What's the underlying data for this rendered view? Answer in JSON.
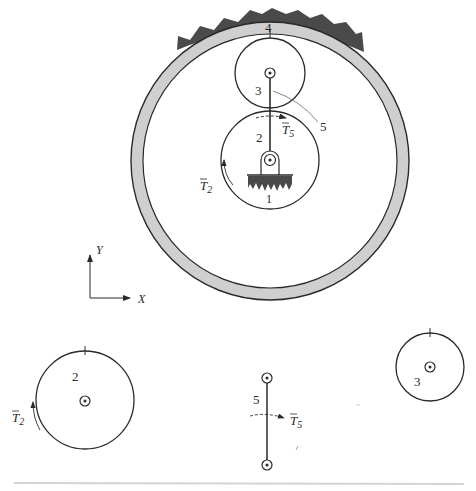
{
  "figure": {
    "type": "planetary gear train with free-body diagrams",
    "assembly": {
      "labels": {
        "ring_gear": "4",
        "planet_gear": "3",
        "sun_gear": "2",
        "ground": "1",
        "arm": "5",
        "torque_arm": "T",
        "torque_arm_sub": "5",
        "torque_sun": "T",
        "torque_sun_sub": "2"
      }
    },
    "axes": {
      "y_label": "Y",
      "x_label": "X"
    },
    "free_bodies": {
      "sun_gear": {
        "label": "2",
        "torque": "T",
        "torque_sub": "2"
      },
      "arm": {
        "label": "5",
        "torque": "T",
        "torque_sub": "5"
      },
      "planet_gear": {
        "label": "3"
      }
    },
    "colors": {
      "line": "#2a2a2a",
      "ring_fill": "#cfcfcf",
      "ground_fill": "#4a4a4a",
      "leader": "#777777",
      "separator": "#d4d4d4"
    }
  }
}
